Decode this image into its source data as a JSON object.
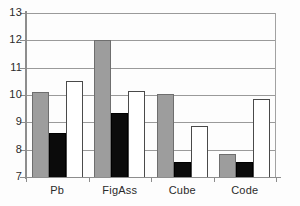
{
  "chart_data": {
    "type": "bar",
    "title": "",
    "xlabel": "",
    "ylabel": "",
    "categories": [
      "Pb",
      "FigAss",
      "Cube",
      "Code"
    ],
    "series": [
      {
        "name": "gray",
        "color": "#9d9d9d",
        "values": [
          10.1,
          12.0,
          10.05,
          7.85
        ]
      },
      {
        "name": "black",
        "color": "#0b0b0b",
        "values": [
          8.6,
          9.35,
          7.55,
          7.55
        ]
      },
      {
        "name": "white",
        "color": "#ffffff",
        "values": [
          10.5,
          10.15,
          8.85,
          9.85
        ]
      }
    ],
    "ylim": [
      7,
      13
    ],
    "y_ticks": [
      7,
      8,
      9,
      10,
      11,
      12,
      13
    ],
    "y_tick_labels": [
      "7",
      "8",
      "9",
      "10",
      "11",
      "12",
      "13"
    ],
    "grid": true,
    "grid_axis": "y",
    "legend": false,
    "legend_position": "none",
    "background_color": "#fdfdfd",
    "grid_color": "#9a9a9a",
    "axis_color": "#8d8d8d"
  }
}
